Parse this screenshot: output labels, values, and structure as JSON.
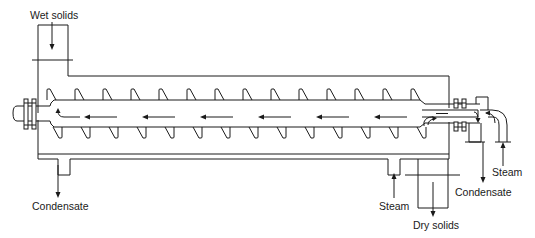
{
  "diagram": {
    "labels": {
      "wet_solids": "Wet solids",
      "condensate_left": "Condensate",
      "steam_bottom": "Steam",
      "dry_solids": "Dry solids",
      "condensate_right": "Condensate",
      "steam_right": "Steam"
    },
    "components": [
      "inlet-hopper",
      "jacketed-trough",
      "screw-shaft",
      "screw-flights",
      "bearing-seal-left",
      "bearing-seal-right",
      "rotary-steam-joint",
      "discharge-outlet",
      "jacket-steam-inlet",
      "jacket-condensate-outlet"
    ],
    "flow_direction": "right-to-left",
    "stroke_color": "#1a1a1a",
    "background": "#ffffff"
  }
}
